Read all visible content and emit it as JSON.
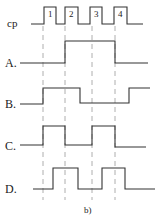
{
  "diagram": {
    "caption": "b)",
    "clock": {
      "label": "cp",
      "pulses": [
        "1",
        "2",
        "3",
        "4"
      ]
    },
    "signals": [
      {
        "label": "A.",
        "description": "High from start of pulse 2 to start of pulse 4"
      },
      {
        "label": "B.",
        "description": "Rises at pulse 1, falls after pulse 2, rises after pulse 4"
      },
      {
        "label": "C.",
        "description": "High during pulse 1 to 2 interval and pulse 3 to 4 interval"
      },
      {
        "label": "D.",
        "description": "High from falling edge of pulse 1 to falling edge of pulse 2, and falling edge of pulse 3 to falling edge of pulse 4"
      }
    ],
    "colors": {
      "line": "#333333",
      "dashed": "#999999",
      "background": "#ffffff"
    }
  }
}
